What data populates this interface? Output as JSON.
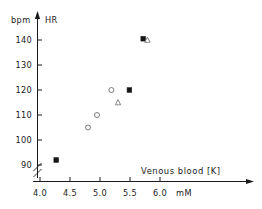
{
  "chart_data": {
    "type": "scatter",
    "title": "",
    "xlabel": "Venous blood [K]",
    "ylabel": "HR",
    "x_unit": "mM",
    "y_unit": "bpm",
    "xlim": [
      3.85,
      6.35
    ],
    "ylim": [
      85,
      145
    ],
    "x_ticks": [
      "4.0",
      "4.5",
      "5.0",
      "5.5",
      "6.0"
    ],
    "x_tick_values": [
      4.0,
      4.5,
      5.0,
      5.5,
      6.0
    ],
    "y_ticks": [
      "90",
      "100",
      "110",
      "120",
      "130",
      "140"
    ],
    "y_tick_values": [
      90,
      100,
      110,
      120,
      130,
      140
    ],
    "grid": false,
    "legend": "none",
    "y_axis_break": true,
    "series": [
      {
        "name": "filled-square",
        "marker": "filled-square",
        "points": [
          {
            "x": 4.27,
            "y": 92
          },
          {
            "x": 5.49,
            "y": 120
          },
          {
            "x": 5.72,
            "y": 140.5
          }
        ]
      },
      {
        "name": "open-circle",
        "marker": "open-circle",
        "points": [
          {
            "x": 4.8,
            "y": 105
          },
          {
            "x": 4.95,
            "y": 110
          },
          {
            "x": 5.19,
            "y": 120
          }
        ]
      },
      {
        "name": "open-triangle",
        "marker": "open-triangle",
        "points": [
          {
            "x": 5.3,
            "y": 115
          },
          {
            "x": 5.79,
            "y": 140
          }
        ]
      }
    ]
  }
}
